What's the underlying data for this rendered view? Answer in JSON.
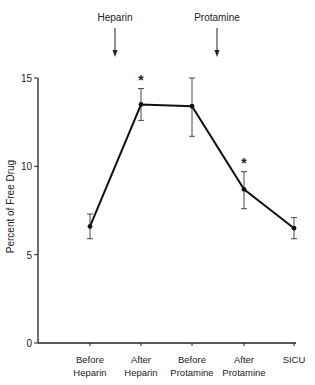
{
  "chart_data": {
    "type": "line",
    "title": "",
    "xlabel": "",
    "ylabel": "Percent of Free Drug",
    "ylim": [
      0,
      15
    ],
    "yticks": [
      0,
      5,
      10,
      15
    ],
    "categories": [
      "Before Heparin",
      "After Heparin",
      "Before Protamine",
      "After Protamine",
      "SICU"
    ],
    "category_lines": [
      [
        "Before",
        "Heparin"
      ],
      [
        "After",
        "Heparin"
      ],
      [
        "Before",
        "Protamine"
      ],
      [
        "After",
        "Protamine"
      ],
      [
        "SICU"
      ]
    ],
    "series": [
      {
        "name": "Percent of Free Drug",
        "values": [
          6.6,
          13.5,
          13.4,
          8.7,
          6.5
        ],
        "error_upper": [
          7.3,
          14.4,
          15.0,
          9.7,
          7.1
        ],
        "error_lower": [
          5.9,
          12.6,
          11.7,
          7.6,
          5.9
        ]
      }
    ],
    "significance_markers": [
      {
        "category": "After Heparin",
        "symbol": "*"
      },
      {
        "category": "After Protamine",
        "symbol": "*"
      }
    ],
    "annotations": [
      {
        "label": "Heparin",
        "type": "arrow-down",
        "between": [
          "Before Heparin",
          "After Heparin"
        ]
      },
      {
        "label": "Protamine",
        "type": "arrow-down",
        "between": [
          "Before Protamine",
          "After Protamine"
        ]
      }
    ],
    "grid": false,
    "legend": "none"
  }
}
